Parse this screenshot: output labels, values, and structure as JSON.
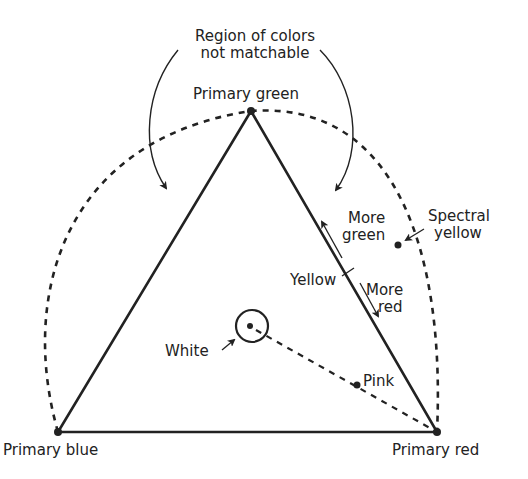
{
  "labels": {
    "region_line1": "Region of colors",
    "region_line2": "not matchable",
    "primary_green": "Primary green",
    "primary_blue": "Primary blue",
    "primary_red": "Primary red",
    "more_green_line1": "More",
    "more_green_line2": "green",
    "more_red_line1": "More",
    "more_red_line2": "red",
    "yellow": "Yellow",
    "spectral_yellow_line1": "Spectral",
    "spectral_yellow_line2": "yellow",
    "white": "White",
    "pink": "Pink"
  },
  "colors": {
    "ink": "#222222",
    "background": "#ffffff"
  }
}
